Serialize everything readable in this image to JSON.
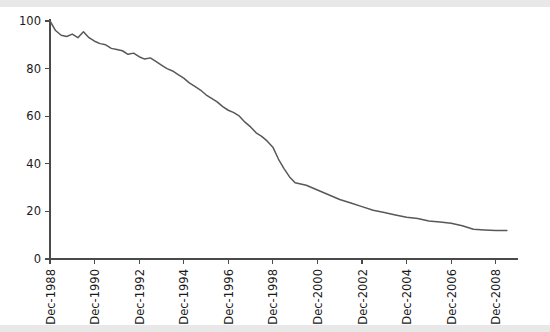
{
  "figure": {
    "background_color": "#ffffff",
    "edge_band_color": "#e8e8e8"
  },
  "chart_data": {
    "type": "line",
    "title": "",
    "subtitle": "",
    "xlabel": "",
    "ylabel": "",
    "grid": false,
    "legend": false,
    "legend_position": "none",
    "line_color": "#585858",
    "axis_color": "#4a4a4a",
    "xlim": [
      "Dec-1988",
      "Dec-2009"
    ],
    "ylim": [
      0,
      100
    ],
    "yticks": [
      0,
      20,
      40,
      60,
      80,
      100
    ],
    "ytick_labels": [
      "0",
      "20",
      "40",
      "60",
      "80",
      "100"
    ],
    "xticks": [
      "Dec-1988",
      "Dec-1990",
      "Dec-1992",
      "Dec-1994",
      "Dec-1996",
      "Dec-1998",
      "Dec-2000",
      "Dec-2002",
      "Dec-2004",
      "Dec-2006",
      "Dec-2008"
    ],
    "xtick_rotation": 90,
    "x_unit": "years since Dec-1988",
    "series": [
      {
        "name": "survival",
        "x": [
          0.0,
          0.25,
          0.5,
          0.75,
          1.0,
          1.25,
          1.5,
          1.75,
          2.0,
          2.25,
          2.5,
          2.75,
          3.0,
          3.25,
          3.5,
          3.75,
          4.0,
          4.25,
          4.5,
          4.75,
          5.0,
          5.25,
          5.5,
          5.75,
          6.0,
          6.25,
          6.5,
          6.75,
          7.0,
          7.25,
          7.5,
          7.75,
          8.0,
          8.25,
          8.5,
          8.75,
          9.0,
          9.25,
          9.5,
          9.75,
          10.0,
          10.25,
          10.5,
          10.75,
          11.0,
          11.5,
          12.0,
          12.5,
          13.0,
          13.5,
          14.0,
          14.5,
          15.0,
          15.5,
          16.0,
          16.5,
          17.0,
          17.5,
          18.0,
          18.5,
          19.0,
          19.5,
          20.0,
          20.5
        ],
        "values": [
          100.0,
          96.0,
          94.0,
          93.5,
          94.5,
          93.0,
          95.5,
          93.0,
          91.5,
          90.5,
          90.0,
          88.5,
          88.0,
          87.5,
          86.0,
          86.5,
          85.0,
          84.0,
          84.5,
          83.0,
          81.5,
          80.0,
          79.0,
          77.5,
          76.0,
          74.0,
          72.5,
          71.0,
          69.0,
          67.5,
          66.0,
          64.0,
          62.5,
          61.5,
          60.0,
          57.5,
          55.5,
          53.0,
          51.5,
          49.5,
          47.0,
          42.0,
          38.0,
          34.5,
          32.0,
          31.0,
          29.0,
          27.0,
          25.0,
          23.5,
          22.0,
          20.5,
          19.5,
          18.5,
          17.5,
          17.0,
          16.0,
          15.5,
          15.0,
          14.0,
          12.5,
          12.2,
          12.0,
          12.0
        ]
      }
    ]
  }
}
